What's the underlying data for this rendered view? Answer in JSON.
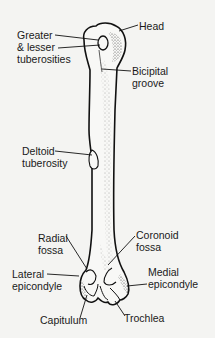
{
  "diagram": {
    "colors": {
      "background": "#f4f4f2",
      "outline": "#111111",
      "stipple": "#555555",
      "label_text": "#1a1a1a"
    },
    "labels": {
      "head": {
        "lines": [
          "Head"
        ]
      },
      "tuberosities": {
        "lines": [
          "Greater",
          "& lesser",
          "tuberosities"
        ]
      },
      "bicipital_groove": {
        "lines": [
          "Bicipital",
          "groove"
        ]
      },
      "deltoid_tuberosity": {
        "lines": [
          "Deltoid",
          "tuberosity"
        ]
      },
      "radial_fossa": {
        "lines": [
          "Radial",
          "fossa"
        ]
      },
      "coronoid_fossa": {
        "lines": [
          "Coronoid",
          "fossa"
        ]
      },
      "lateral_epicondyle": {
        "lines": [
          "Lateral",
          "epicondyle"
        ]
      },
      "medial_epicondyle": {
        "lines": [
          "Medial",
          "epicondyle"
        ]
      },
      "capitulum": {
        "lines": [
          "Capitulum"
        ]
      },
      "trochlea": {
        "lines": [
          "Trochlea"
        ]
      }
    }
  }
}
